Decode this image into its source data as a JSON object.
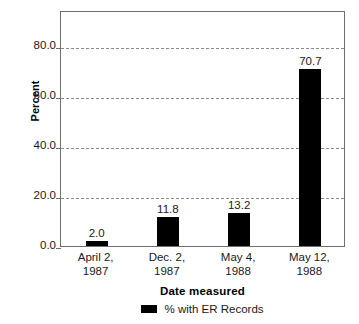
{
  "chart_data": {
    "type": "bar",
    "title": "",
    "xlabel": "Date measured",
    "ylabel": "Percent",
    "categories": [
      "April 2,\n1987",
      "Dec. 2,\n1987",
      "May 4,\n1988",
      "May 12,\n1988"
    ],
    "category_lines": [
      [
        "April 2,",
        "1987"
      ],
      [
        "Dec. 2,",
        "1987"
      ],
      [
        "May 4,",
        "1988"
      ],
      [
        "May 12,",
        "1988"
      ]
    ],
    "values": [
      2.0,
      11.8,
      13.2,
      70.7
    ],
    "value_labels": [
      "2.0",
      "11.8",
      "13.2",
      "70.7"
    ],
    "series": [
      {
        "name": "% with ER Records",
        "values": [
          2.0,
          11.8,
          13.2,
          70.7
        ],
        "color": "#000000"
      }
    ],
    "ylim": [
      0,
      94.5
    ],
    "yticks": [
      0.0,
      20.0,
      40.0,
      60.0,
      80.0
    ],
    "ytick_labels": [
      "0.0",
      "20.0",
      "40.0",
      "60.0",
      "80.0"
    ],
    "grid": true,
    "grid_style": "dashed-horizontal",
    "legend_position": "bottom-center",
    "bar_color": "#000000",
    "frame_color": "#6e6e6e"
  },
  "legend": {
    "entries": [
      {
        "label": "% with ER Records",
        "color": "#000000"
      }
    ]
  },
  "axes": {
    "y_title": "Percent",
    "x_title": "Date measured"
  }
}
